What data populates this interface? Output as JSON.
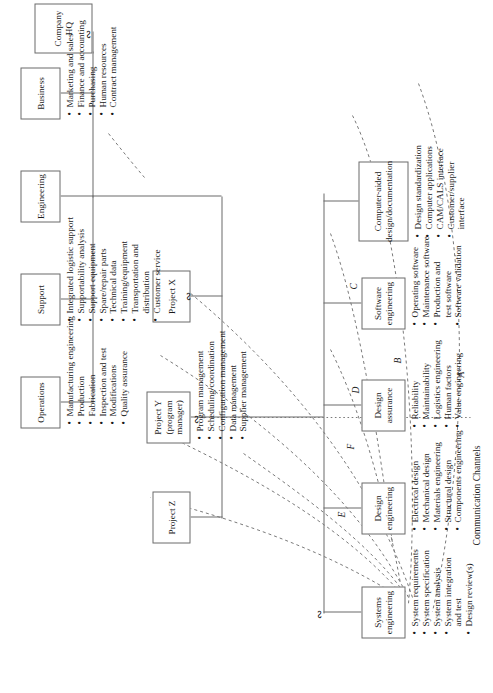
{
  "diagram": {
    "footer_label": "Communication Channels"
  },
  "nodes": {
    "company_hq": {
      "label": "Company HQ"
    },
    "business": {
      "label": "Business"
    },
    "engineering": {
      "label": "Engineering"
    },
    "support": {
      "label": "Support"
    },
    "operations": {
      "label": "Operations"
    },
    "project_x": {
      "label": "Project X"
    },
    "project_y": {
      "label": "Project Y",
      "label2": "(program manager)"
    },
    "project_z": {
      "label": "Project Z"
    },
    "systems_engineering": {
      "label": "Systems",
      "label2": "engineering"
    },
    "design_engineering": {
      "label": "Design",
      "label2": "engineering"
    },
    "design_assurance": {
      "label": "Design",
      "label2": "assurance"
    },
    "software_engineering": {
      "label": "Software",
      "label2": "engineering"
    },
    "cad_documentation": {
      "label": "Computer-aided",
      "label2": "design/documentation"
    }
  },
  "bullets": {
    "business": [
      "Marketing and sales",
      "Finance and accounting",
      "Purchasing",
      "Human resources",
      "Contract management"
    ],
    "support": [
      "Integrated logistic support",
      "Supportability analysis",
      "Support equipment",
      "Spare/repair parts",
      "Technical data",
      "Training/equipment",
      "Transportation and",
      "distribution",
      "Customer service"
    ],
    "support_continuation_index": 7,
    "operations": [
      "Manufacturing engineering",
      "Production",
      "Fabrication",
      "Inspection and test",
      "Modifications",
      "Quality assurance"
    ],
    "project_y": [
      "Program management",
      "Scheduling/coordination",
      "Configuration management",
      "Data management",
      "Supplier management"
    ],
    "systems_engineering": [
      "System requirements",
      "System specification",
      "System analysis",
      "System integration",
      "and test",
      "Design review(s)"
    ],
    "systems_engineering_continuation_index": 4,
    "design_engineering": [
      "Electrical design",
      "Mechanical design",
      "Materials engineering",
      "Structural design",
      "Components engineering"
    ],
    "design_assurance": [
      "Reliability",
      "Maintainability",
      "Logistics engineering",
      "Human factors",
      "Value engineering"
    ],
    "software_engineering": [
      "Operating software",
      "Maintenance software",
      "Production and",
      "test software",
      "Software validation"
    ],
    "software_engineering_continuation_index": 3,
    "cad_documentation": [
      "Design standardization",
      "Computer applications",
      "CAM/CALS interface",
      "Customer/supplier",
      "interface"
    ],
    "cad_documentation_continuation_index": 4
  },
  "channels": [
    {
      "id": "A",
      "label": "A"
    },
    {
      "id": "B",
      "label": "B"
    },
    {
      "id": "C",
      "label": "C"
    },
    {
      "id": "D",
      "label": "D"
    },
    {
      "id": "E",
      "label": "E"
    },
    {
      "id": "F",
      "label": "F"
    }
  ],
  "colors": {
    "line": "#6b6b6b",
    "dashed": "#7a7a7a",
    "text": "#1a1a1a",
    "background": "#ffffff"
  }
}
